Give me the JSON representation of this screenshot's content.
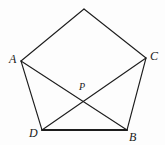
{
  "figure": {
    "kind": "geometry-diagram",
    "canvas": {
      "width": 165,
      "height": 145,
      "background": "#fdfdfd"
    },
    "stroke": {
      "color": "#1d1d1d",
      "normal_width": 1.1,
      "emphasis_width": 2.2
    },
    "label_color": "#1a1a1a",
    "points": [
      {
        "id": "apex",
        "label": "",
        "x": 84,
        "y": 9,
        "labelled": false
      },
      {
        "id": "A",
        "label": "A",
        "x": 21,
        "y": 61,
        "labelled": true,
        "label_x": 9,
        "label_y": 53
      },
      {
        "id": "C",
        "label": "C",
        "x": 146,
        "y": 58,
        "labelled": true,
        "label_x": 150,
        "label_y": 50
      },
      {
        "id": "D",
        "label": "D",
        "x": 42,
        "y": 130,
        "labelled": true,
        "label_x": 29,
        "label_y": 127
      },
      {
        "id": "B",
        "label": "B",
        "x": 127,
        "y": 130,
        "labelled": true,
        "label_x": 129,
        "label_y": 131
      },
      {
        "id": "P",
        "label": "P",
        "x": 83,
        "y": 97,
        "labelled": true,
        "label_x": 79,
        "label_y": 82
      }
    ],
    "edges": [
      {
        "id": "apex-A",
        "from": "apex",
        "to": "A",
        "kind": "side",
        "emphasis": false
      },
      {
        "id": "apex-C",
        "from": "apex",
        "to": "C",
        "kind": "side",
        "emphasis": false
      },
      {
        "id": "A-D",
        "from": "A",
        "to": "D",
        "kind": "side",
        "emphasis": false
      },
      {
        "id": "C-B",
        "from": "C",
        "to": "B",
        "kind": "side",
        "emphasis": false
      },
      {
        "id": "D-B",
        "from": "D",
        "to": "B",
        "kind": "side",
        "emphasis": true
      },
      {
        "id": "A-B",
        "from": "A",
        "to": "B",
        "kind": "diagonal",
        "emphasis": false
      },
      {
        "id": "C-D",
        "from": "C",
        "to": "D",
        "kind": "diagonal",
        "emphasis": false
      }
    ],
    "labels": {
      "a": "A",
      "b": "B",
      "c": "C",
      "d": "D",
      "p": "P"
    }
  }
}
